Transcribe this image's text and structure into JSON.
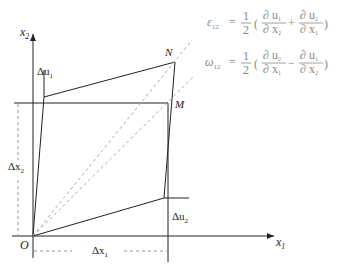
{
  "diagram": {
    "axes": {
      "x1": {
        "label": "x",
        "sub": "1"
      },
      "x2": {
        "label": "x",
        "sub": "2"
      },
      "origin": "O"
    },
    "points": {
      "N": "N",
      "M": "M"
    },
    "dimensions": {
      "du1": {
        "label": "Δu",
        "sub": "1"
      },
      "du2": {
        "label": "Δu",
        "sub": "2"
      },
      "dx1": {
        "label": "Δx",
        "sub": "1"
      },
      "dx2": {
        "label": "Δx",
        "sub": "2"
      }
    },
    "equations": {
      "strain": {
        "lhs": "ε",
        "lhs_sub": "12",
        "eq": "=",
        "coef_num": "1",
        "coef_den": "2",
        "t1_num": "∂ u",
        "t1_num_sub": "1",
        "t1_den": "∂ x",
        "t1_den_sub": "2",
        "op": "+",
        "t2_num": "∂ u",
        "t2_num_sub": "2",
        "t2_den": "∂ x",
        "t2_den_sub": "1"
      },
      "rotation": {
        "lhs": "ω",
        "lhs_sub": "12",
        "eq": "=",
        "coef_num": "1",
        "coef_den": "2",
        "t1_num": "∂ u",
        "t1_num_sub": "2",
        "t1_den": "∂ x",
        "t1_den_sub": "1",
        "op": "−",
        "t2_num": "∂ u",
        "t2_num_sub": "1",
        "t2_den": "∂ x",
        "t2_den_sub": "2"
      }
    },
    "colors": {
      "line": "#222222",
      "dashed": "#aaaaaa",
      "equation": "#888888"
    }
  }
}
